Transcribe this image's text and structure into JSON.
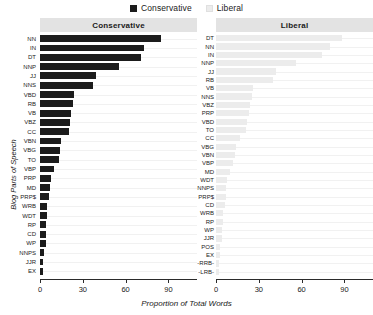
{
  "legend": {
    "items": [
      {
        "label": "Conservative",
        "color": "#1c1c1c",
        "icon": "square-swatch-icon"
      },
      {
        "label": "Liberal",
        "color": "#ececec",
        "icon": "square-swatch-icon"
      }
    ]
  },
  "axes": {
    "x_title": "Proportion of Total Words",
    "y_title": "Blog Parts of Speech",
    "x_ticks": [
      "0",
      "30",
      "60",
      "90"
    ]
  },
  "panels": [
    {
      "title": "Conservative"
    },
    {
      "title": "Liberal"
    }
  ],
  "chart_data": {
    "type": "bar",
    "orientation": "horizontal",
    "title": "",
    "subtitle": "",
    "xlabel": "Proportion of Total Words",
    "ylabel": "Blog Parts of Speech",
    "xlim": [
      0,
      110
    ],
    "xticks": [
      0,
      30,
      60,
      90
    ],
    "grid": true,
    "legend": [
      "Conservative",
      "Liberal"
    ],
    "legend_position": "top-center",
    "facets": [
      {
        "name": "Conservative",
        "color": "#1c1c1c",
        "categories": [
          "NN",
          "IN",
          "DT",
          "NNP",
          "JJ",
          "NNS",
          "VBD",
          "RB",
          "VB",
          "VBZ",
          "CC",
          "VBN",
          "VBG",
          "TO",
          "VBP",
          "PRP",
          "MD",
          "PRP$",
          "WRB",
          "WDT",
          "RP",
          "CD",
          "WP",
          "NNPS",
          "JJR",
          "EX"
        ],
        "values": [
          85,
          73,
          71,
          55,
          39,
          37,
          24,
          23,
          22,
          21,
          20,
          15,
          14,
          13,
          10,
          8,
          7,
          6,
          5,
          5,
          4,
          4,
          4,
          3,
          2,
          2
        ]
      },
      {
        "name": "Liberal",
        "color": "#ececec",
        "categories": [
          "DT",
          "NN",
          "IN",
          "NNP",
          "JJ",
          "RB",
          "VB",
          "NNS",
          "VBZ",
          "PRP",
          "VBD",
          "TO",
          "CC",
          "VBG",
          "VBN",
          "VBP",
          "MD",
          "WDT",
          "NNPS",
          "PRP$",
          "CD",
          "WRB",
          "RP",
          "WP",
          "JJR",
          "POS",
          "EX",
          "-RRB-",
          "-LRB-"
        ],
        "values": [
          88,
          80,
          74,
          56,
          42,
          40,
          26,
          25,
          24,
          23,
          22,
          21,
          17,
          14,
          13,
          12,
          10,
          8,
          7,
          7,
          6,
          5,
          5,
          4,
          4,
          3,
          3,
          2,
          2
        ]
      }
    ]
  }
}
